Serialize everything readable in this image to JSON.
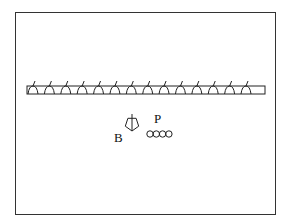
{
  "diagram": {
    "strip": {
      "unit_count": 14,
      "unit_shape": "arch-with-tick"
    },
    "labels": {
      "b": "B",
      "p": "P"
    },
    "symbols": {
      "b_symbol": "pentagon-with-stem-icon",
      "p_symbol": "four-circle-chain-icon",
      "p_circle_count": 4
    },
    "colors": {
      "stroke": "#222222",
      "background": "#ffffff",
      "frame": "#333333"
    }
  }
}
